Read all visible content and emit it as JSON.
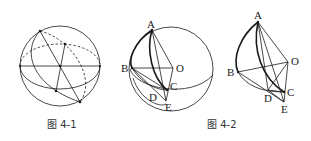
{
  "figures": [
    {
      "id": "fig-4-1",
      "caption": "图 4-1",
      "labels": []
    },
    {
      "id": "fig-4-2a",
      "caption": "",
      "labels": {
        "A": "A",
        "B": "B",
        "O": "O",
        "C": "C",
        "D": "D",
        "E": "E"
      }
    },
    {
      "id": "fig-4-2b",
      "caption": "图 4-2",
      "labels": {
        "A": "A",
        "B": "B",
        "O": "O",
        "C": "C",
        "D": "D",
        "E": "E"
      }
    }
  ],
  "colors": {
    "stroke": "#1a1a1a",
    "background": "#ffffff"
  }
}
